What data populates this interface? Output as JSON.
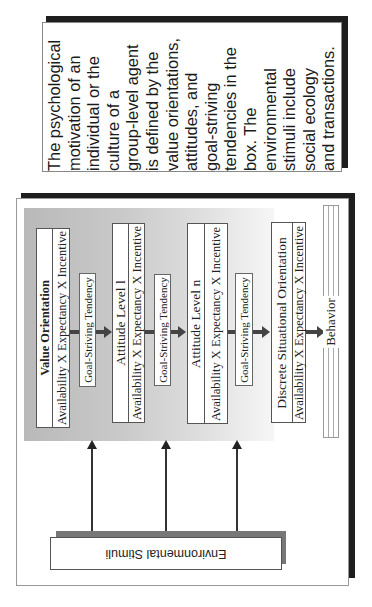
{
  "note": {
    "lines": [
      "The psychological",
      "motivation of an",
      "individual or the",
      "culture of a",
      "group-level agent",
      "is defined by the",
      "value orientations,",
      "attitudes, and",
      "goal-striving",
      "tendencies in the",
      "box.  The",
      "environmental",
      "stimuli include",
      "social ecology",
      "and transactions."
    ]
  },
  "diagram": {
    "levels": [
      {
        "title": "Value Orientation",
        "formula": "Availability  X  Expectancy  X  Incentive"
      },
      {
        "title": "Attitude Level l",
        "formula": "Availability  X  Expectancy  X  Incentive"
      },
      {
        "title": "Attitude Level n",
        "formula": "Availability  X  Expectancy  X  Incentive"
      },
      {
        "title": "Discrete Situational Orientation",
        "formula": "Availability  X  Expectancy  X  Incentive"
      }
    ],
    "tendency_label": "Goal-Striving Tendency",
    "behavior_label": "Behavior",
    "environment_label": "Environmental Stimuli"
  },
  "colors": {
    "shadow": "#1e1e1e",
    "arrow": "#444444"
  }
}
